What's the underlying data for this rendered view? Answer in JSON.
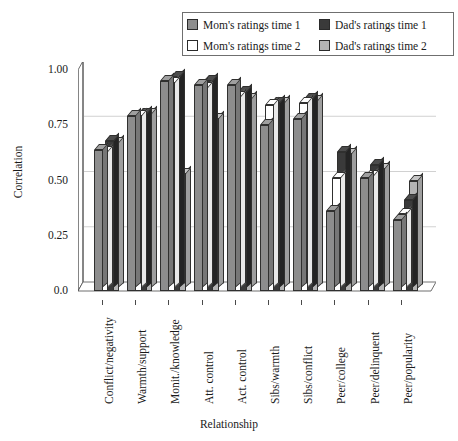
{
  "chart_data": {
    "type": "bar",
    "title": "",
    "xlabel": "Relationship",
    "ylabel": "Correlation",
    "ylim": [
      0.0,
      1.0
    ],
    "yticks": [
      "0.0",
      "0.25",
      "0.50",
      "0.75",
      "1.00"
    ],
    "ytick_values": [
      0.0,
      0.25,
      0.5,
      0.75,
      1.0
    ],
    "grid": true,
    "legend_position": "top-right",
    "categories": [
      "Conflict/negativity",
      "Warmth/support",
      "Monit./knowledge",
      "Att. control",
      "Act. control",
      "Sibs/warmth",
      "Sibs/conflict",
      "Peer/college",
      "Peer/delinquent",
      "Peer/popularity"
    ],
    "series": [
      {
        "name": "Mom's ratings time 1",
        "color": "#8d8d8d",
        "values": [
          0.64,
          0.79,
          0.95,
          0.93,
          0.93,
          0.75,
          0.78,
          0.36,
          0.51,
          0.32
        ]
      },
      {
        "name": "Mom's ratings time 2",
        "color": "#ffffff",
        "values": [
          0.63,
          0.79,
          0.94,
          0.92,
          0.88,
          0.84,
          0.85,
          0.51,
          0.52,
          0.35
        ]
      },
      {
        "name": "Dad's ratings time 1",
        "color": "#3a3a3a",
        "values": [
          0.68,
          0.8,
          0.97,
          0.95,
          0.9,
          0.85,
          0.87,
          0.63,
          0.57,
          0.41
        ]
      },
      {
        "name": "Dad's ratings time 2",
        "color": "#b4b4b4",
        "values": [
          0.67,
          0.8,
          0.53,
          0.78,
          0.87,
          0.85,
          0.86,
          0.62,
          0.55,
          0.5
        ]
      }
    ]
  },
  "legend": {
    "items": [
      {
        "label": "Mom's ratings time 1",
        "swatch": "#8d8d8d"
      },
      {
        "label": "Dad's ratings time 1",
        "swatch": "#3a3a3a"
      },
      {
        "label": "Mom's ratings time 2",
        "swatch": "#ffffff"
      },
      {
        "label": "Dad's ratings time 2",
        "swatch": "#b4b4b4"
      }
    ]
  }
}
